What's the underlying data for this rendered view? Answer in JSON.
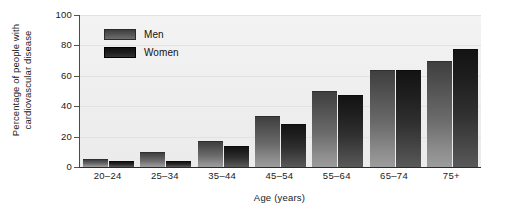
{
  "chart_data": {
    "type": "bar",
    "title": "",
    "xlabel": "Age (years)",
    "ylabel": "Percentage of people with\ncardiovascular disease",
    "ylabel_line1": "Percentage of people with",
    "ylabel_line2": "cardiovascular disease",
    "categories": [
      "20–24",
      "25–34",
      "35–44",
      "45–54",
      "55–64",
      "65–74",
      "75+"
    ],
    "series": [
      {
        "name": "Men",
        "values": [
          5,
          10,
          17,
          33.5,
          50,
          64,
          70
        ]
      },
      {
        "name": "Women",
        "values": [
          4,
          4,
          13.5,
          28,
          47.5,
          64,
          77.5
        ]
      }
    ],
    "ylim": [
      0,
      100
    ],
    "yticks": [
      0,
      20,
      40,
      60,
      80,
      100
    ],
    "ytick_labels": [
      "0",
      "20",
      "40",
      "60",
      "80",
      "100"
    ],
    "grid": true,
    "grid_axis": "y",
    "legend_position": "upper left inside",
    "colors": {
      "men": "#6b6b6b",
      "women": "#1d1d1d",
      "plot_background": "#eeeeee",
      "axis": "#2b2b2b",
      "text": "#1a1a1a",
      "figure_background": "#ffffff"
    }
  },
  "legend": {
    "items": [
      {
        "label": "Men",
        "swatch": "men-swatch"
      },
      {
        "label": "Women",
        "swatch": "women-swatch"
      }
    ]
  }
}
